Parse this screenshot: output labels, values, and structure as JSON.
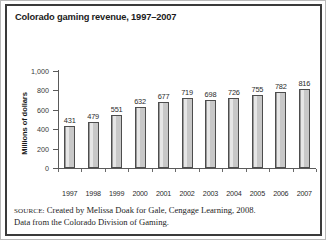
{
  "figure": {
    "title": "Colorado gaming revenue, 1997–2007",
    "source_label": "SOURCE:",
    "source_line1": " Created by Melissa Doak for Gale, Cengage Learning, 2008.",
    "source_line2": "Data from the Colorado Division of Gaming."
  },
  "chart_data": {
    "type": "bar",
    "title": "Colorado gaming revenue, 1997–2007",
    "xlabel": "",
    "ylabel": "Millions of dollars",
    "categories": [
      "1997",
      "1998",
      "1999",
      "2000",
      "2001",
      "2002",
      "2003",
      "2004",
      "2005",
      "2006",
      "2007"
    ],
    "values": [
      431,
      479,
      551,
      632,
      677,
      719,
      698,
      726,
      755,
      782,
      816
    ],
    "ylim": [
      0,
      1000
    ],
    "yticks": [
      0,
      200,
      400,
      600,
      800,
      1000
    ],
    "ytick_labels": [
      "0",
      "200",
      "400",
      "600",
      "800",
      "1,000"
    ],
    "grid": false,
    "legend": false,
    "data_labels": true,
    "bar_color": "#c8c8c8",
    "bar_edge_color": "#4d4d4d"
  }
}
